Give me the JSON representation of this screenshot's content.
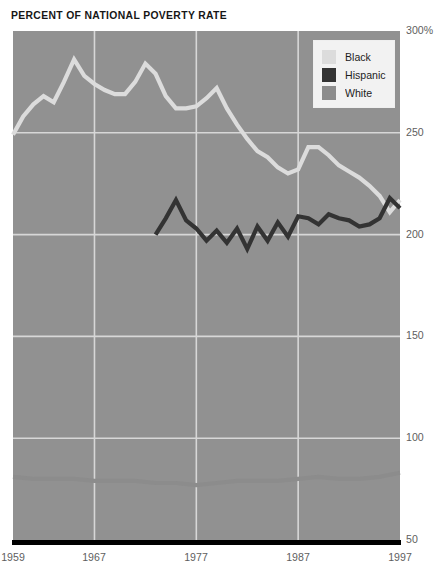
{
  "chart_data": {
    "type": "line",
    "title": "PERCENT OF NATIONAL POVERTY RATE",
    "xlabel": "",
    "ylabel": "",
    "ylim": [
      50,
      300
    ],
    "xlim": [
      1959,
      1997
    ],
    "grid": true,
    "y_ticks": [
      {
        "value": 300,
        "label": "300%"
      },
      {
        "value": 250,
        "label": "250"
      },
      {
        "value": 200,
        "label": "200"
      },
      {
        "value": 150,
        "label": "150"
      },
      {
        "value": 100,
        "label": "100"
      },
      {
        "value": 50,
        "label": "50"
      }
    ],
    "x_ticks": [
      {
        "value": 1959,
        "label": "1959"
      },
      {
        "value": 1967,
        "label": "1967"
      },
      {
        "value": 1977,
        "label": "1977"
      },
      {
        "value": 1987,
        "label": "1987"
      },
      {
        "value": 1997,
        "label": "1997"
      }
    ],
    "legend": {
      "position": "top-right",
      "entries": [
        {
          "name": "Black",
          "color": "#dcdcdc"
        },
        {
          "name": "Hispanic",
          "color": "#333333"
        },
        {
          "name": "White",
          "color": "#8c8c8c"
        }
      ]
    },
    "plot_background": "#919191",
    "gridline_color": "#d7d7d7",
    "axis_color": "#000000",
    "series": [
      {
        "name": "Black",
        "color": "#dcdcdc",
        "x": [
          1959,
          1960,
          1961,
          1962,
          1963,
          1964,
          1965,
          1966,
          1967,
          1968,
          1969,
          1970,
          1971,
          1972,
          1973,
          1974,
          1975,
          1976,
          1977,
          1978,
          1979,
          1980,
          1981,
          1982,
          1983,
          1984,
          1985,
          1986,
          1987,
          1988,
          1989,
          1990,
          1991,
          1992,
          1993,
          1994,
          1995,
          1996,
          1997
        ],
        "y": [
          249,
          258,
          264,
          268,
          265,
          275,
          286,
          278,
          274,
          271,
          269,
          269,
          275,
          284,
          279,
          268,
          262,
          262,
          263,
          267,
          272,
          262,
          254,
          247,
          241,
          238,
          233,
          230,
          232,
          243,
          243,
          239,
          234,
          231,
          228,
          224,
          219,
          211,
          217
        ]
      },
      {
        "name": "Hispanic",
        "color": "#333333",
        "x": [
          1973,
          1974,
          1975,
          1976,
          1977,
          1978,
          1979,
          1980,
          1981,
          1982,
          1983,
          1984,
          1985,
          1986,
          1987,
          1988,
          1989,
          1990,
          1991,
          1992,
          1993,
          1994,
          1995,
          1996,
          1997
        ],
        "y": [
          200,
          208,
          217,
          207,
          203,
          197,
          202,
          196,
          203,
          193,
          204,
          197,
          206,
          199,
          209,
          208,
          205,
          210,
          208,
          207,
          204,
          205,
          208,
          218,
          213
        ]
      },
      {
        "name": "White",
        "color": "#8c8c8c",
        "x": [
          1959,
          1961,
          1963,
          1965,
          1967,
          1969,
          1971,
          1973,
          1975,
          1977,
          1979,
          1981,
          1983,
          1985,
          1987,
          1989,
          1991,
          1993,
          1995,
          1997
        ],
        "y": [
          81,
          80,
          80,
          80,
          79,
          79,
          79,
          78,
          78,
          77,
          78,
          79,
          79,
          79,
          80,
          81,
          80,
          80,
          81,
          83
        ]
      }
    ]
  },
  "geometry": {
    "plot_left": 13,
    "plot_right": 400,
    "plot_top": 31,
    "plot_bottom": 540,
    "legend_box": {
      "left": 313,
      "top": 40,
      "width": 82,
      "height": 68
    }
  }
}
